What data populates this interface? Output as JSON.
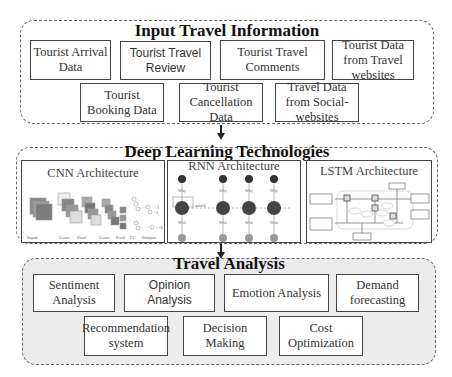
{
  "sections": {
    "input": {
      "title": "Input Travel Information",
      "items": [
        {
          "label": "Tourist Arrival Data"
        },
        {
          "label": "Tourist Travel Review"
        },
        {
          "label": "Tourist Travel Comments"
        },
        {
          "label": "Tourist Data from Travel websites"
        },
        {
          "label": "Tourist Booking Data"
        },
        {
          "label": "Tourist Cancellation Data"
        },
        {
          "label": "Travel Data from Social-websites"
        }
      ]
    },
    "deep_learning": {
      "title": "Deep Learning Technologies",
      "architectures": [
        {
          "label": "CNN Architecture",
          "layer_labels": [
            "Input",
            "Conv",
            "Pool",
            "Conv",
            "Pool",
            "FC",
            "Output"
          ]
        },
        {
          "label": "RNN  Architecture"
        },
        {
          "label": "LSTM Architecture"
        }
      ]
    },
    "analysis": {
      "title": "Travel Analysis",
      "items": [
        {
          "label": "Sentiment Analysis"
        },
        {
          "label": "Opinion Analysis"
        },
        {
          "label": "Emotion Analysis"
        },
        {
          "label": "Demand forecasting"
        },
        {
          "label": "Recommendation system"
        },
        {
          "label": "Decision Making"
        },
        {
          "label": "Cost Optimization"
        }
      ]
    }
  },
  "colors": {
    "analysis_background": "#ececec",
    "border": "#444444",
    "dashed_border": "#666666"
  }
}
